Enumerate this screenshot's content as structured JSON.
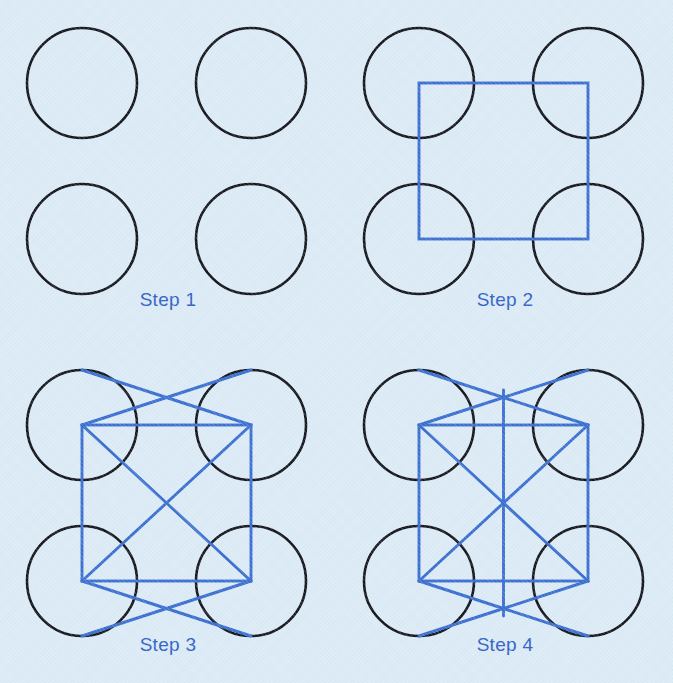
{
  "figure": {
    "width": 673,
    "height": 683,
    "background_color": "#dcebf6",
    "circle_stroke_color": "#15161c",
    "line_stroke_color": "#3a6fd0",
    "label_color": "#2f62c4"
  },
  "panels": [
    {
      "id": "step-1",
      "label": "Step 1",
      "circle_count": 4,
      "shapes": [
        "circle",
        "circle",
        "circle",
        "circle"
      ],
      "blue_line_count": 0,
      "note": "four circles only"
    },
    {
      "id": "step-2",
      "label": "Step 2",
      "circle_count": 4,
      "shapes": [
        "circle",
        "circle",
        "circle",
        "circle",
        "square"
      ],
      "blue_line_count": 4,
      "note": "square joining the four circle centres"
    },
    {
      "id": "step-3",
      "label": "Step 3",
      "circle_count": 4,
      "shapes": [
        "circle",
        "circle",
        "circle",
        "circle",
        "square",
        "diagonal",
        "diagonal",
        "wing",
        "wing",
        "wing",
        "wing"
      ],
      "blue_line_count": 10,
      "note": "square plus both diagonals plus four crossing wing lines at top and bottom"
    },
    {
      "id": "step-4",
      "label": "Step 4",
      "circle_count": 4,
      "shapes": [
        "circle",
        "circle",
        "circle",
        "circle",
        "square",
        "diagonal",
        "diagonal",
        "wing",
        "wing",
        "wing",
        "wing",
        "vertical-axis"
      ],
      "blue_line_count": 11,
      "note": "same as step 3 plus a vertical centre line joining the upper and lower crossing points"
    }
  ],
  "geometry": {
    "circle_radius": 55,
    "circle_centers": [
      {
        "cx": 82,
        "cy": 83
      },
      {
        "cx": 251,
        "cy": 83
      },
      {
        "cx": 82,
        "cy": 239
      },
      {
        "cx": 251,
        "cy": 239
      }
    ],
    "square": {
      "x1": 82,
      "y1": 83,
      "x2": 251,
      "y2": 239
    },
    "wing_endpoints_top": [
      {
        "x": 82,
        "y": 28
      },
      {
        "x": 251,
        "y": 28
      }
    ],
    "wing_endpoints_bottom": [
      {
        "x": 82,
        "y": 294
      },
      {
        "x": 251,
        "y": 294
      }
    ],
    "vertical_axis": {
      "x": 166,
      "y_top": 48,
      "y_bottom": 274
    }
  }
}
